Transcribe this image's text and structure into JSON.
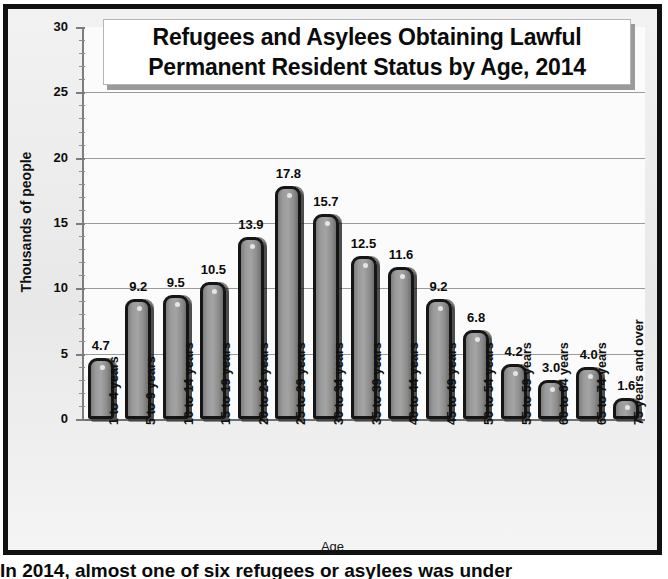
{
  "chart_data": {
    "type": "bar",
    "title": "Refugees and Asylees Obtaining Lawful Permanent Resident Status by Age, 2014",
    "title_lines": [
      "Refugees and Asylees Obtaining Lawful",
      "Permanent Resident Status by Age, 2014"
    ],
    "xlabel": "Age",
    "ylabel": "Thousands of people",
    "ylim": [
      0,
      30
    ],
    "ytick_labels": [
      "0",
      "5",
      "10",
      "15",
      "20",
      "25",
      "30"
    ],
    "ytick_values": [
      0,
      5,
      10,
      15,
      20,
      25,
      30
    ],
    "ytick_minor_step": 1,
    "grid": "horizontal",
    "legend": "none",
    "categories": [
      "1 to 4 years",
      "5 to 9 years",
      "10 to 14 years",
      "15 to 19 years",
      "20 to 24 years",
      "25 to 29 years",
      "30 to 34 years",
      "35 to 39 years",
      "40 to 44 years",
      "45 to 49 years",
      "50 to 54 years",
      "55 to 59 years",
      "60 to 64 years",
      "65 to 74 years",
      "75 years and over"
    ],
    "values": [
      4.7,
      9.2,
      9.5,
      10.5,
      13.9,
      17.8,
      15.7,
      12.5,
      11.6,
      9.2,
      6.8,
      4.2,
      3.0,
      4.0,
      1.6
    ],
    "value_labels": [
      "4.7",
      "9.2",
      "9.5",
      "10.5",
      "13.9",
      "17.8",
      "15.7",
      "12.5",
      "11.6",
      "9.2",
      "6.8",
      "4.2",
      "3.0",
      "4.0",
      "1.6"
    ]
  },
  "caption": {
    "text": "In 2014, almost one of six refugees or asylees was under"
  },
  "colors": {
    "frame": "#111111",
    "chart_background": "#ebebeb",
    "plot_background": "#fbfbfb",
    "bar_fill": "#9a9a9a",
    "bar_outline": "#151515",
    "gridline": "#9b9b9b",
    "text": "#0b0b0b",
    "title_background": "#ffffff"
  }
}
